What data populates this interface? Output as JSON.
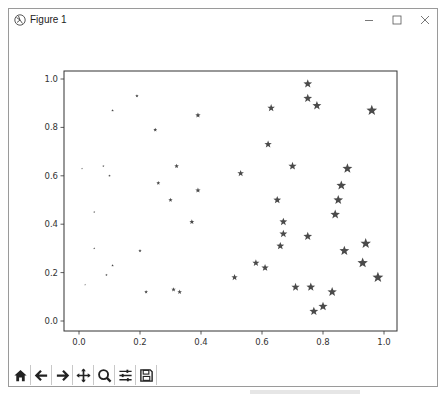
{
  "window": {
    "title": "Figure 1",
    "controls": {
      "minimize": "—",
      "maximize": "☐",
      "close": "✕"
    }
  },
  "toolbar": {
    "buttons": [
      {
        "name": "home-button",
        "icon": "home-icon",
        "tooltip": "Home"
      },
      {
        "name": "back-button",
        "icon": "arrow-left-icon",
        "tooltip": "Back"
      },
      {
        "name": "forward-button",
        "icon": "arrow-right-icon",
        "tooltip": "Forward"
      },
      {
        "name": "pan-button",
        "icon": "move-icon",
        "tooltip": "Pan"
      },
      {
        "name": "zoom-button",
        "icon": "magnifier-icon",
        "tooltip": "Zoom"
      },
      {
        "name": "configure-subplots-button",
        "icon": "sliders-icon",
        "tooltip": "Configure subplots"
      },
      {
        "name": "save-button",
        "icon": "floppy-disk-icon",
        "tooltip": "Save"
      }
    ]
  },
  "colors": {
    "marker": "#4a4a4a",
    "axis": "#333333",
    "text": "#333333"
  },
  "chart_data": {
    "type": "scatter",
    "title": "",
    "xlabel": "",
    "ylabel": "",
    "xlim": [
      -0.05,
      1.04
    ],
    "ylim": [
      -0.04,
      1.04
    ],
    "xticks": [
      "0.0",
      "0.2",
      "0.4",
      "0.6",
      "0.8",
      "1.0"
    ],
    "yticks": [
      "0.0",
      "0.2",
      "0.4",
      "0.6",
      "0.8",
      "1.0"
    ],
    "grid": false,
    "marker": "star",
    "size_encodes": "x",
    "points": [
      {
        "x": 0.01,
        "y": 0.63
      },
      {
        "x": 0.02,
        "y": 0.15
      },
      {
        "x": 0.05,
        "y": 0.45
      },
      {
        "x": 0.05,
        "y": 0.3
      },
      {
        "x": 0.08,
        "y": 0.64
      },
      {
        "x": 0.09,
        "y": 0.19
      },
      {
        "x": 0.1,
        "y": 0.6
      },
      {
        "x": 0.11,
        "y": 0.23
      },
      {
        "x": 0.11,
        "y": 0.87
      },
      {
        "x": 0.19,
        "y": 0.93
      },
      {
        "x": 0.2,
        "y": 0.29
      },
      {
        "x": 0.22,
        "y": 0.12
      },
      {
        "x": 0.25,
        "y": 0.79
      },
      {
        "x": 0.26,
        "y": 0.57
      },
      {
        "x": 0.3,
        "y": 0.5
      },
      {
        "x": 0.31,
        "y": 0.13
      },
      {
        "x": 0.32,
        "y": 0.64
      },
      {
        "x": 0.33,
        "y": 0.12
      },
      {
        "x": 0.37,
        "y": 0.41
      },
      {
        "x": 0.39,
        "y": 0.85
      },
      {
        "x": 0.39,
        "y": 0.54
      },
      {
        "x": 0.51,
        "y": 0.18
      },
      {
        "x": 0.53,
        "y": 0.61
      },
      {
        "x": 0.58,
        "y": 0.24
      },
      {
        "x": 0.61,
        "y": 0.22
      },
      {
        "x": 0.62,
        "y": 0.73
      },
      {
        "x": 0.63,
        "y": 0.88
      },
      {
        "x": 0.65,
        "y": 0.5
      },
      {
        "x": 0.66,
        "y": 0.31
      },
      {
        "x": 0.67,
        "y": 0.36
      },
      {
        "x": 0.67,
        "y": 0.41
      },
      {
        "x": 0.7,
        "y": 0.64
      },
      {
        "x": 0.71,
        "y": 0.14
      },
      {
        "x": 0.75,
        "y": 0.98
      },
      {
        "x": 0.75,
        "y": 0.92
      },
      {
        "x": 0.75,
        "y": 0.35
      },
      {
        "x": 0.76,
        "y": 0.14
      },
      {
        "x": 0.77,
        "y": 0.04
      },
      {
        "x": 0.78,
        "y": 0.89
      },
      {
        "x": 0.8,
        "y": 0.06
      },
      {
        "x": 0.83,
        "y": 0.12
      },
      {
        "x": 0.84,
        "y": 0.44
      },
      {
        "x": 0.85,
        "y": 0.5
      },
      {
        "x": 0.86,
        "y": 0.56
      },
      {
        "x": 0.87,
        "y": 0.29
      },
      {
        "x": 0.88,
        "y": 0.63
      },
      {
        "x": 0.93,
        "y": 0.24
      },
      {
        "x": 0.94,
        "y": 0.32
      },
      {
        "x": 0.96,
        "y": 0.87
      },
      {
        "x": 0.98,
        "y": 0.18
      }
    ]
  }
}
